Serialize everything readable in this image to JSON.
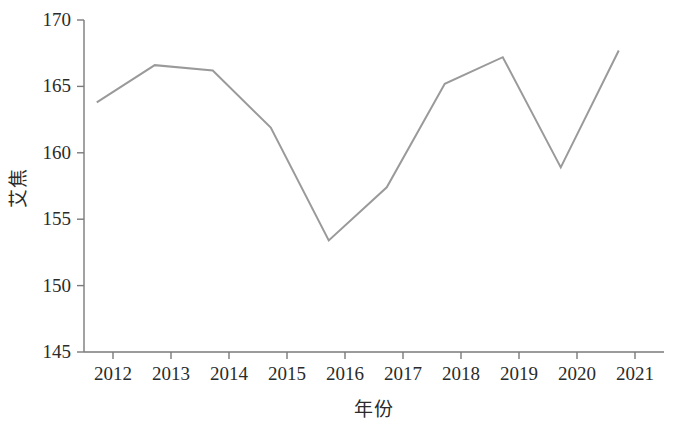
{
  "chart_data": {
    "type": "line",
    "title": "",
    "xlabel": "年份",
    "ylabel": "艾焦",
    "categories": [
      "2012",
      "2013",
      "2014",
      "2015",
      "2016",
      "2017",
      "2018",
      "2019",
      "2020",
      "2021"
    ],
    "x": [
      2012,
      2013,
      2014,
      2015,
      2016,
      2017,
      2018,
      2019,
      2020,
      2021
    ],
    "values": [
      163.8,
      166.6,
      166.2,
      161.9,
      153.4,
      157.4,
      165.2,
      167.2,
      158.9,
      167.7
    ],
    "series": [
      {
        "name": "艾焦",
        "values": [
          163.8,
          166.6,
          166.2,
          161.9,
          153.4,
          157.4,
          165.2,
          167.2,
          158.9,
          167.7
        ]
      }
    ],
    "ylim": [
      145,
      170
    ],
    "yticks": [
      145,
      150,
      155,
      160,
      165,
      170
    ],
    "ytick_labels": [
      "145",
      "150",
      "155",
      "160",
      "165",
      "170"
    ],
    "xtick_labels": [
      "2012",
      "2013",
      "2014",
      "2015",
      "2016",
      "2017",
      "2018",
      "2019",
      "2020",
      "2021"
    ],
    "grid": false,
    "legend": false,
    "legend_position": "none",
    "line_color": "#9a9a9a",
    "axis_color": "#7a7a7a",
    "text_color": "#2b2b2b",
    "line_width": 2,
    "markers": false
  },
  "axes": {
    "y_tick_labels": [
      "170",
      "165",
      "160",
      "155",
      "150",
      "145"
    ],
    "x_tick_labels": [
      "2012",
      "2013",
      "2014",
      "2015",
      "2016",
      "2017",
      "2018",
      "2019",
      "2020",
      "2021"
    ],
    "y_axis_title": "艾焦",
    "x_axis_title": "年份"
  }
}
